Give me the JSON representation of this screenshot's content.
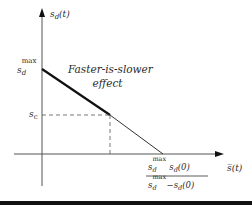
{
  "diagram": {
    "y_axis_label": {
      "base": "s",
      "sub": "d",
      "rest": "(t)"
    },
    "x_axis_label": {
      "base": "s̅",
      "rest": "(t)"
    },
    "y_intercept_label": {
      "base": "s",
      "sub": "d",
      "sup": "max"
    },
    "sc_label": {
      "base": "s",
      "sub": "c"
    },
    "annotation": {
      "line1": "Faster-is-slower",
      "line2": "effect"
    },
    "x_intercept_label": {
      "numerator": {
        "base": "s",
        "sub": "d",
        "sup": "max",
        "rest_base": " s",
        "rest_sub": "d",
        "rest": "(0)"
      },
      "denominator": {
        "base": "s",
        "sub": "d",
        "sup": "max",
        "rest_base": "−s",
        "rest_sub": "d",
        "rest": "(0)"
      }
    },
    "colors": {
      "line": "#1a1a1a",
      "axis": "#555555",
      "text": "#2a2a2a"
    }
  }
}
